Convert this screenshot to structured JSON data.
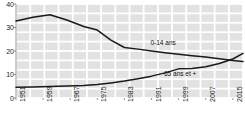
{
  "chart_data": {
    "type": "line",
    "title": "",
    "subtitle": "",
    "xlabel": "",
    "ylabel": "",
    "xlim": [
      1951,
      2018
    ],
    "ylim": [
      0,
      40
    ],
    "yticks": [
      0,
      10,
      20,
      30,
      40
    ],
    "ytick_labels": [
      "0",
      "10",
      "20",
      "30",
      "40"
    ],
    "xticks": [
      1951,
      1959,
      1967,
      1975,
      1983,
      1991,
      1999,
      2007,
      2015
    ],
    "xtick_labels": [
      "1951",
      "1959",
      "1967",
      "1975",
      "1983",
      "1991",
      "1999",
      "2007",
      "2015"
    ],
    "grid": true,
    "grid_style": "shaded-blocks",
    "legend_position": "inline-annotations",
    "line_color": "#1a1a1a",
    "grid_color": "#e2e2e2",
    "background_color": "#ffffff",
    "series": [
      {
        "name": "0-14 ans",
        "label": "0-14 ans",
        "annotation_x": 1996,
        "annotation_y": 23.5,
        "x": [
          1951,
          1956,
          1961,
          1966,
          1971,
          1975,
          1979,
          1983,
          1987,
          1991,
          1995,
          1999,
          2003,
          2007,
          2011,
          2015,
          2018
        ],
        "values": [
          32.8,
          34.4,
          35.4,
          33.2,
          30.4,
          28.9,
          24.6,
          21.5,
          20.8,
          20.0,
          19.3,
          18.6,
          18.0,
          17.4,
          16.7,
          16.0,
          15.5
        ]
      },
      {
        "name": "65 ans et +",
        "label": "65 ans et +",
        "annotation_x": 2000,
        "annotation_y": 10.3,
        "x": [
          1951,
          1956,
          1961,
          1966,
          1971,
          1975,
          1979,
          1983,
          1987,
          1991,
          1995,
          1999,
          2003,
          2007,
          2011,
          2015,
          2018
        ],
        "values": [
          4.6,
          4.7,
          4.9,
          5.1,
          5.3,
          5.7,
          6.4,
          7.2,
          8.2,
          9.3,
          10.7,
          12.4,
          12.6,
          13.3,
          14.7,
          16.6,
          19.0
        ]
      }
    ]
  }
}
